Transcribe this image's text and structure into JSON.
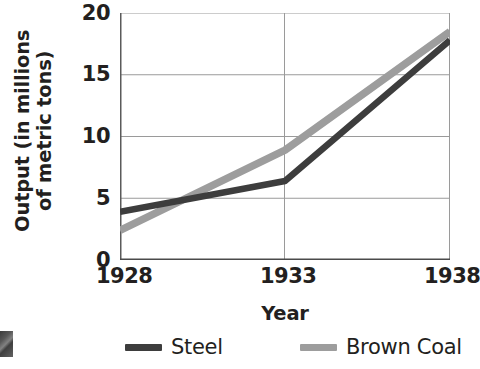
{
  "chart_data": {
    "type": "line",
    "title": "",
    "xlabel": "Year",
    "ylabel": "Output (in millions of metric tons)",
    "ylabel_line1": "Output (in millions",
    "ylabel_line2": "of metric tons)",
    "x": [
      1928,
      1933,
      1938
    ],
    "categories": [
      "1928",
      "1933",
      "1938"
    ],
    "xticklabels": [
      "1928",
      "1933",
      "1938"
    ],
    "yticklabels": [
      "0",
      "5",
      "10",
      "15",
      "20"
    ],
    "yticks": [
      0,
      5,
      10,
      15,
      20
    ],
    "ylim": [
      0,
      20
    ],
    "xlim": [
      1928,
      1938
    ],
    "grid": "horizontal-and-vertical",
    "legend_position": "bottom",
    "series": [
      {
        "name": "Steel",
        "color": "#3d3d3d",
        "values": [
          3.9,
          6.4,
          17.8
        ]
      },
      {
        "name": "Brown Coal",
        "color": "#9d9d9d",
        "values": [
          2.4,
          8.9,
          18.5
        ]
      }
    ]
  },
  "legend": {
    "items": [
      {
        "label": "Steel",
        "color": "#3d3d3d"
      },
      {
        "label": "Brown Coal",
        "color": "#9d9d9d"
      }
    ]
  },
  "axes": {
    "axis_color": "#555555",
    "grid_color": "#9a9a9a"
  }
}
